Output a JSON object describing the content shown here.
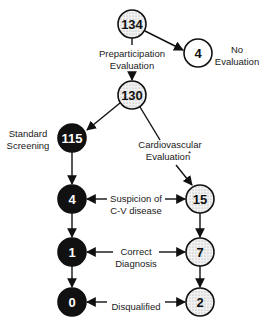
{
  "diagram": {
    "type": "flowchart",
    "colors": {
      "black_node_fill": "#111111",
      "dotted_node_fill": "#e6e6e6",
      "white_node_fill": "#ffffff",
      "stroke": "#111111",
      "text_dark": "#111111",
      "text_light": "#ffffff"
    },
    "nodes": {
      "n134": {
        "value": "134",
        "style": "dotted"
      },
      "n4_none": {
        "value": "4",
        "style": "white"
      },
      "n130": {
        "value": "130",
        "style": "dotted"
      },
      "n115": {
        "value": "115",
        "style": "black"
      },
      "n15": {
        "value": "15",
        "style": "dotted"
      },
      "n4_std": {
        "value": "4",
        "style": "black"
      },
      "n1": {
        "value": "1",
        "style": "black"
      },
      "n7": {
        "value": "7",
        "style": "dotted"
      },
      "n0": {
        "value": "0",
        "style": "black"
      },
      "n2": {
        "value": "2",
        "style": "dotted"
      }
    },
    "labels": {
      "preparticipation_line1": "Preparticipation",
      "preparticipation_line2": "Evaluation",
      "no_eval_line1": "No",
      "no_eval_line2": "Evaluation",
      "standard_line1": "Standard",
      "standard_line2": "Screening",
      "cardio_line1": "Cardiovascular",
      "cardio_line2": "Evaluation",
      "cardio_footnote": "*",
      "suspicion_line1": "Suspicion of",
      "suspicion_line2": "C-V disease",
      "correct_line1": "Correct",
      "correct_line2": "Diagnosis",
      "disqualified": "Disqualified"
    }
  }
}
